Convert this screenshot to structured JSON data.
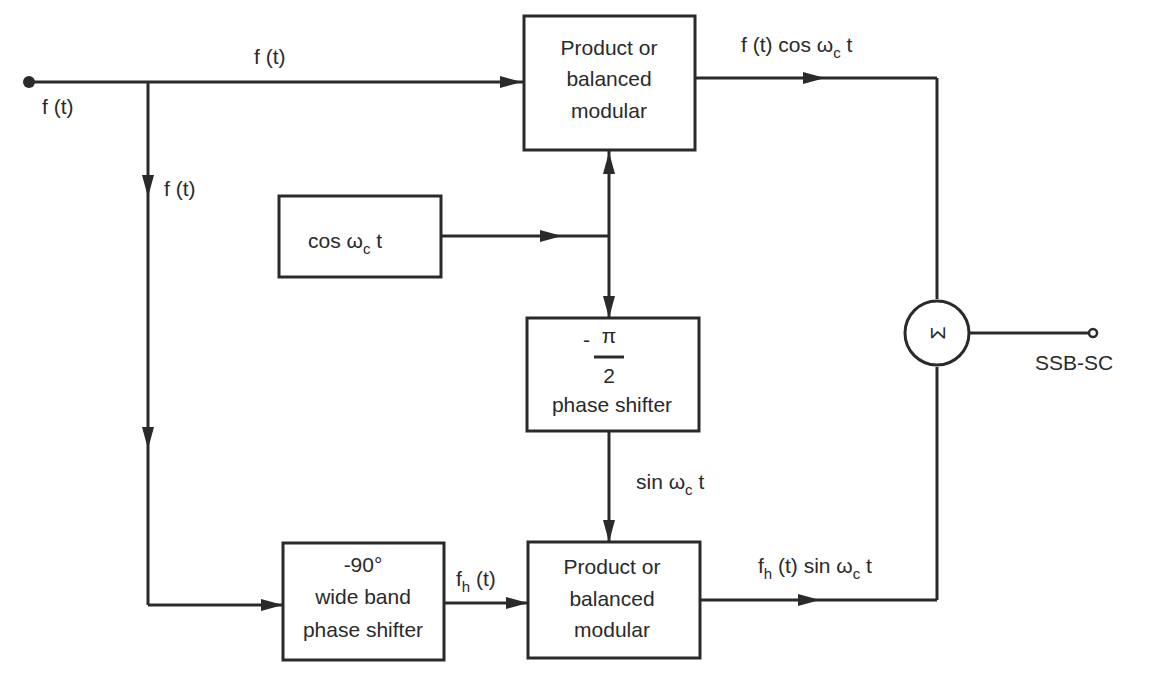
{
  "diagram": {
    "input": {
      "label": "f (t)"
    },
    "branch_top_label": "f (t)",
    "branch_down_label": "f (t)",
    "top_modulator": {
      "lines": [
        "Product or",
        "balanced",
        "modular"
      ]
    },
    "oscillator": {
      "prefix": "cos ",
      "omega": "ω",
      "sub": "c",
      "suffix": " t"
    },
    "phase_shifter_90": {
      "num": "π",
      "neg": "-",
      "den": "2",
      "caption": "phase shifter"
    },
    "sin_label": {
      "prefix": "sin ",
      "omega": "ω",
      "sub": "c",
      "suffix": " t"
    },
    "wideband_shifter": {
      "lines": [
        "-90°",
        "wide band",
        "phase shifter"
      ]
    },
    "fh_label": {
      "f": "f",
      "sub": "h",
      "suffix": " (t)"
    },
    "bottom_modulator": {
      "lines": [
        "Product or",
        "balanced",
        "modular"
      ]
    },
    "top_output_label": {
      "prefix": "f (t) cos ",
      "omega": "ω",
      "sub": "c",
      "suffix": " t"
    },
    "bottom_output_label": {
      "f": "f",
      "sub": "h",
      "mid": " (t) sin ",
      "omega": "ω",
      "sub2": "c",
      "suffix": " t"
    },
    "mixer": {
      "symbol": "Σ"
    },
    "output": {
      "label": "SSB-SC"
    }
  }
}
